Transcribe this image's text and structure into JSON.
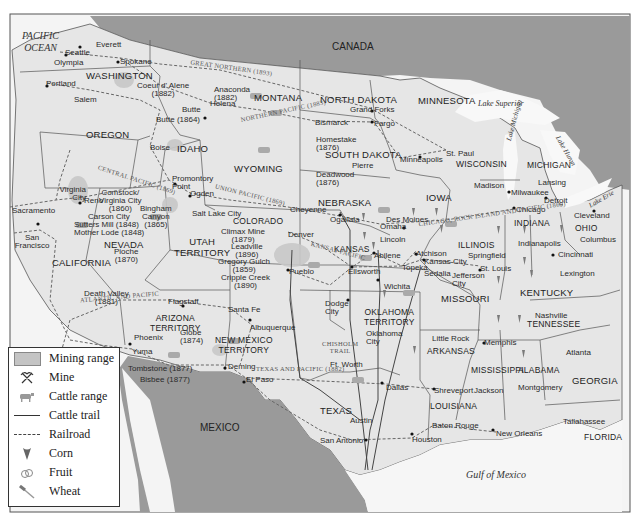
{
  "map": {
    "water_labels": {
      "pacific_ocean": "PACIFIC\nOCEAN",
      "gulf_of_mexico": "Gulf of Mexico",
      "lake_superior": "Lake Superior",
      "lake_michigan": "Lake Michigan",
      "lake_huron": "Lake Huron",
      "lake_erie": "Lake Erie"
    },
    "countries": {
      "canada": "CANADA",
      "mexico": "MEXICO"
    },
    "states": {
      "washington": "WASHINGTON",
      "oregon": "OREGON",
      "california": "CALIFORNIA",
      "nevada": "NEVADA",
      "idaho": "IDAHO",
      "montana": "MONTANA",
      "wyoming": "WYOMING",
      "utah": "UTAH\nTERRITORY",
      "colorado": "COLORADO",
      "arizona": "ARIZONA\nTERRITORY",
      "new_mexico": "NEW MEXICO\nTERRITORY",
      "north_dakota": "NORTH DAKOTA",
      "south_dakota": "SOUTH DAKOTA",
      "nebraska": "NEBRASKA",
      "kansas": "KANSAS",
      "oklahoma": "OKLAHOMA\nTERRITORY",
      "texas": "TEXAS",
      "minnesota": "MINNESOTA",
      "iowa": "IOWA",
      "missouri": "MISSOURI",
      "arkansas": "ARKANSAS",
      "louisiana": "LOUISIANA",
      "wisconsin": "WISCONSIN",
      "illinois": "ILLINOIS",
      "michigan": "MICHIGAN",
      "indiana": "INDIANA",
      "ohio": "OHIO",
      "kentucky": "KENTUCKY",
      "tennessee": "TENNESSEE",
      "mississippi": "MISSISSIPPI",
      "alabama": "ALABAMA",
      "georgia": "GEORGIA",
      "florida": "FLORIDA"
    },
    "cities": [
      {
        "name": "Everett",
        "x": 82,
        "y": 44
      },
      {
        "name": "Seattle",
        "x": 64,
        "y": 52
      },
      {
        "name": "Olympia",
        "x": 56,
        "y": 61
      },
      {
        "name": "Spokane",
        "x": 120,
        "y": 59
      },
      {
        "name": "Portland",
        "x": 47,
        "y": 83
      },
      {
        "name": "Salem",
        "x": 72,
        "y": 98
      },
      {
        "name": "Boise",
        "x": 150,
        "y": 146
      },
      {
        "name": "Helena",
        "x": 210,
        "y": 103
      },
      {
        "name": "Bismarck",
        "x": 315,
        "y": 121
      },
      {
        "name": "Grand Forks",
        "x": 350,
        "y": 108
      },
      {
        "name": "Fargo",
        "x": 374,
        "y": 122
      },
      {
        "name": "Pierre",
        "x": 352,
        "y": 164
      },
      {
        "name": "St. Paul",
        "x": 446,
        "y": 151
      },
      {
        "name": "Minneapolis",
        "x": 400,
        "y": 158
      },
      {
        "name": "Madison",
        "x": 474,
        "y": 183
      },
      {
        "name": "Milwaukee",
        "x": 508,
        "y": 192
      },
      {
        "name": "Lansing",
        "x": 538,
        "y": 181
      },
      {
        "name": "Detroit",
        "x": 544,
        "y": 199
      },
      {
        "name": "Chicago",
        "x": 514,
        "y": 209
      },
      {
        "name": "Cleveland",
        "x": 594,
        "y": 211
      },
      {
        "name": "Columbus",
        "x": 580,
        "y": 238
      },
      {
        "name": "Cincinnati",
        "x": 558,
        "y": 253
      },
      {
        "name": "Lexington",
        "x": 562,
        "y": 272
      },
      {
        "name": "Indianapolis",
        "x": 518,
        "y": 241
      },
      {
        "name": "Springfield",
        "x": 468,
        "y": 254
      },
      {
        "name": "St. Louis",
        "x": 480,
        "y": 266
      },
      {
        "name": "Jefferson City",
        "x": 450,
        "y": 272
      },
      {
        "name": "Des Moines",
        "x": 386,
        "y": 217
      },
      {
        "name": "Omaha",
        "x": 380,
        "y": 224
      },
      {
        "name": "Lincoln",
        "x": 380,
        "y": 237
      },
      {
        "name": "Ogallala",
        "x": 340,
        "y": 216
      },
      {
        "name": "Cheyenne",
        "x": 288,
        "y": 207
      },
      {
        "name": "Denver",
        "x": 285,
        "y": 232
      },
      {
        "name": "Pueblo",
        "x": 288,
        "y": 270
      },
      {
        "name": "Atchison",
        "x": 416,
        "y": 251
      },
      {
        "name": "Kansas City",
        "x": 424,
        "y": 259
      },
      {
        "name": "Sedalia",
        "x": 424,
        "y": 270
      },
      {
        "name": "Topeka",
        "x": 402,
        "y": 266
      },
      {
        "name": "Abilene",
        "x": 374,
        "y": 253
      },
      {
        "name": "Ellsworth",
        "x": 352,
        "y": 267
      },
      {
        "name": "Wichita",
        "x": 382,
        "y": 283
      },
      {
        "name": "Dodge City",
        "x": 330,
        "y": 300
      },
      {
        "name": "Oklahoma City",
        "x": 372,
        "y": 330
      },
      {
        "name": "Ft. Worth",
        "x": 330,
        "y": 363
      },
      {
        "name": "Dallas",
        "x": 386,
        "y": 384
      },
      {
        "name": "Shreveport",
        "x": 434,
        "y": 389
      },
      {
        "name": "Austin",
        "x": 362,
        "y": 418
      },
      {
        "name": "San Antonio",
        "x": 352,
        "y": 440
      },
      {
        "name": "Houston",
        "x": 412,
        "y": 438
      },
      {
        "name": "Baton Rouge",
        "x": 434,
        "y": 425
      },
      {
        "name": "New Orleans",
        "x": 496,
        "y": 432
      },
      {
        "name": "Little Rock",
        "x": 438,
        "y": 336
      },
      {
        "name": "Memphis",
        "x": 483,
        "y": 341
      },
      {
        "name": "Jackson",
        "x": 473,
        "y": 389
      },
      {
        "name": "Nashville",
        "x": 535,
        "y": 314
      },
      {
        "name": "Montgomery",
        "x": 542,
        "y": 383
      },
      {
        "name": "Atlanta",
        "x": 568,
        "y": 351
      },
      {
        "name": "Tallahassee",
        "x": 563,
        "y": 418
      },
      {
        "name": "Ogden",
        "x": 190,
        "y": 193
      },
      {
        "name": "Promontory Point",
        "x": 169,
        "y": 180
      },
      {
        "name": "Salt Lake City",
        "x": 196,
        "y": 211
      },
      {
        "name": "Virginia City",
        "x": 56,
        "y": 186
      },
      {
        "name": "Reno",
        "x": 84,
        "y": 197
      },
      {
        "name": "Carson City",
        "x": 90,
        "y": 213
      },
      {
        "name": "Sacramento",
        "x": 10,
        "y": 207
      },
      {
        "name": "San Francisco",
        "x": 14,
        "y": 233
      },
      {
        "name": "Los Angeles",
        "x": 40,
        "y": 429
      },
      {
        "name": "Flagstaff",
        "x": 168,
        "y": 300
      },
      {
        "name": "Phoenix",
        "x": 134,
        "y": 336
      },
      {
        "name": "Yuma",
        "x": 132,
        "y": 349
      },
      {
        "name": "Santa Fe",
        "x": 230,
        "y": 308
      },
      {
        "name": "Albuquerque",
        "x": 252,
        "y": 325
      },
      {
        "name": "Deming",
        "x": 228,
        "y": 365
      },
      {
        "name": "El Paso",
        "x": 246,
        "y": 378
      }
    ],
    "mines": [
      {
        "name": "Coeur d' Alene\n(1882)",
        "x": 120,
        "y": 82
      },
      {
        "name": "Anaconda\n(1882)",
        "x": 218,
        "y": 87
      },
      {
        "name": "Butte",
        "x": 182,
        "y": 108
      },
      {
        "name": "Butte (1864)",
        "x": 158,
        "y": 117
      },
      {
        "name": "Homestake\n(1876)",
        "x": 315,
        "y": 136
      },
      {
        "name": "Deadwood\n(1876)",
        "x": 316,
        "y": 175
      },
      {
        "name": "Comstock/\nVirginia City\n(1860)",
        "x": 99,
        "y": 191
      },
      {
        "name": "Sutters Mill (1848)\nMother Lode (1848)",
        "x": 74,
        "y": 220
      },
      {
        "name": "Bingham\nCanyon\n(1865)",
        "x": 140,
        "y": 207
      },
      {
        "name": "Pioche\n(1870)",
        "x": 114,
        "y": 251
      },
      {
        "name": "Death Valley\n(1881)",
        "x": 84,
        "y": 292
      },
      {
        "name": "Climax Mine\n(1879)",
        "x": 221,
        "y": 228
      },
      {
        "name": "Leadville\n(1896)",
        "x": 231,
        "y": 244
      },
      {
        "name": "Gregory Gulch\n(1859)",
        "x": 218,
        "y": 260
      },
      {
        "name": "Cripple Creek\n(1890)",
        "x": 221,
        "y": 275
      },
      {
        "name": "Globe\n(1874)",
        "x": 178,
        "y": 330
      },
      {
        "name": "Tombstone (1877)",
        "x": 128,
        "y": 365
      },
      {
        "name": "Bisbee (1877)",
        "x": 140,
        "y": 376
      }
    ],
    "railroads": {
      "great_northern": "GREAT NORTHERN (1893)",
      "northern_pacific": "NORTHERN PACIFIC (1883)",
      "oregon_short_line": "OREGON SHORT LINE",
      "central_pacific": "CENTRAL PACIFIC (1869)",
      "union_pacific": "UNION PACIFIC (1869)",
      "southern_pacific": "SOUTHERN PACIFIC",
      "atlantic_pacific": "ATLANTIC AND PACIFIC",
      "kansas_pacific": "KANSAS PACIFIC",
      "atchison_topeka": "ATCHISON TOPEKA AND SANTA FE (1884)",
      "chicago_rock_island": "CHICAGO, ROCK ISLAND AND PACIFIC (1869)",
      "texas_pacific": "TEXAS AND PACIFIC (1882)",
      "southern_pacific_tx": "SOUTHERN PACIFIC (1883)"
    },
    "cattle_trails": {
      "chisholm": "CHISHOLM\nTRAIL",
      "western": "WESTERN TRAIL",
      "sedalia": "SEDALIA TRAIL",
      "goodnight": "GOODNIGHT-LOVING TRAIL"
    }
  },
  "legend": {
    "items": [
      {
        "label": "Mining range",
        "icon": "mining-range-swatch"
      },
      {
        "label": "Mine",
        "icon": "mine-pickaxe-icon"
      },
      {
        "label": "Cattle range",
        "icon": "cattle-icon"
      },
      {
        "label": "Cattle trail",
        "icon": "solid-line"
      },
      {
        "label": "Railroad",
        "icon": "dashed-line"
      },
      {
        "label": "Corn",
        "icon": "corn-icon"
      },
      {
        "label": "Fruit",
        "icon": "fruit-icon"
      },
      {
        "label": "Wheat",
        "icon": "wheat-icon"
      }
    ]
  },
  "colors": {
    "land": "#e6e6e6",
    "foreign_land": "#9a9a9a",
    "water": "#f4f4f4",
    "border": "#444444",
    "railroad": "#666666",
    "mining_range": "#c4c4c4",
    "crop_icon": "#777777"
  }
}
